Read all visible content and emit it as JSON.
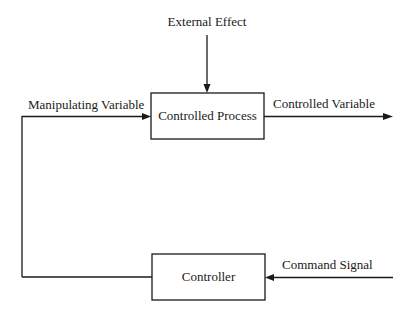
{
  "diagram": {
    "type": "feedback-control-block-diagram",
    "blocks": {
      "process": {
        "label": "Controlled Process"
      },
      "controller": {
        "label": "Controller"
      }
    },
    "signals": {
      "external_effect": "External Effect",
      "manipulating_variable": "Manipulating Variable",
      "controlled_variable": "Controlled Variable",
      "command_signal": "Command Signal"
    },
    "colors": {
      "line": "#1a1a1a",
      "background": "#ffffff"
    }
  }
}
